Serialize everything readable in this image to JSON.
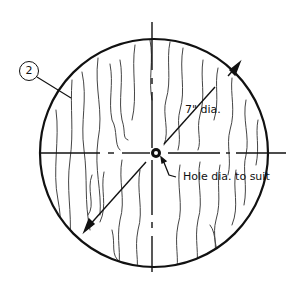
{
  "diagram": {
    "part_number": "2",
    "dimension_label": "7\" dia.",
    "hole_label": "Hole dia. to suit",
    "colors": {
      "line": "#111111",
      "grain": "#444444",
      "background": "#ffffff"
    }
  }
}
